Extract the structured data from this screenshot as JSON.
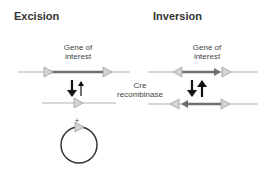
{
  "diagram": {
    "excision": {
      "title": "Excision",
      "gene_label_line1": "Gene of",
      "gene_label_line2": "interest",
      "circle_marker": "+"
    },
    "inversion": {
      "title": "Inversion",
      "gene_label_line1": "Gene of",
      "gene_label_line2": "interest"
    },
    "enzyme": {
      "line1": "Cre",
      "line2": "recombinase"
    },
    "colors": {
      "dna_line": "#b0b0b0",
      "gene": "#6e6e6e",
      "lox_site_fill": "#d4d4d4",
      "lox_site_stroke": "#a0a0a0",
      "arrow": "#111111",
      "circle": "#333333"
    }
  }
}
